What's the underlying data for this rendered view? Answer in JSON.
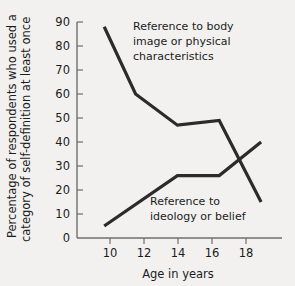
{
  "chart_data": {
    "type": "line",
    "title": "",
    "xlabel": "Age in years",
    "ylabel": "Percentage of respondents who used a category of self-definition at least once",
    "ylabel_line1": "Percentage of respondents who used a",
    "ylabel_line2": "category of self-definition at least once",
    "xlim": [
      9.2,
      19.0
    ],
    "ylim": [
      0,
      90
    ],
    "grid": false,
    "legend": "none (inline annotations)",
    "xticks": [
      10,
      12,
      14,
      16,
      18
    ],
    "xtick_labels": [
      "10",
      "12",
      "14",
      "16",
      "18"
    ],
    "yticks": [
      0,
      10,
      20,
      30,
      40,
      50,
      60,
      70,
      80,
      90
    ],
    "ytick_labels": [
      "0",
      "10",
      "20",
      "30",
      "40",
      "50",
      "60",
      "70",
      "80",
      "90"
    ],
    "series": [
      {
        "name": "Reference to body image or physical characteristics",
        "x": [
          10.5,
          12,
          14,
          16,
          18
        ],
        "values": [
          88,
          60,
          47,
          49,
          15
        ],
        "color": "#2b2b2b"
      },
      {
        "name": "Reference to ideology or belief",
        "x": [
          10.5,
          14,
          16,
          18
        ],
        "values": [
          5,
          26,
          26,
          40
        ],
        "color": "#2b2b2b"
      }
    ],
    "annotations": [
      {
        "id": "annotation-body-image",
        "lines": [
          "Reference to body",
          "image or physical",
          "characteristics"
        ]
      },
      {
        "id": "annotation-ideology",
        "lines": [
          "Reference to",
          "ideology or belief"
        ]
      }
    ],
    "colors": {
      "background": "#f2f1ef",
      "axis": "#6f6f6f",
      "line": "#2b2b2b",
      "text": "#1c1c1c"
    }
  }
}
